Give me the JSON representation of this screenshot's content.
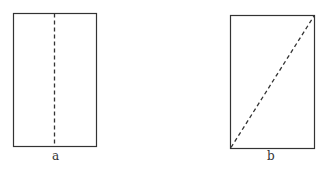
{
  "figures": [
    {
      "label": "a",
      "description": "rectangle folded along vertical center line",
      "rect": {
        "x": 13,
        "y": 13,
        "w": 83,
        "h": 133
      },
      "fold_line": {
        "x1": 54.5,
        "y1": 13,
        "x2": 54.5,
        "y2": 146
      }
    },
    {
      "label": "b",
      "description": "rectangle folded along diagonal",
      "rect": {
        "x": 230,
        "y": 15,
        "w": 84,
        "h": 133
      },
      "fold_line": {
        "x1": 230,
        "y1": 148,
        "x2": 314,
        "y2": 15
      }
    }
  ],
  "colors": {
    "stroke": "#333333",
    "background": "#ffffff"
  }
}
